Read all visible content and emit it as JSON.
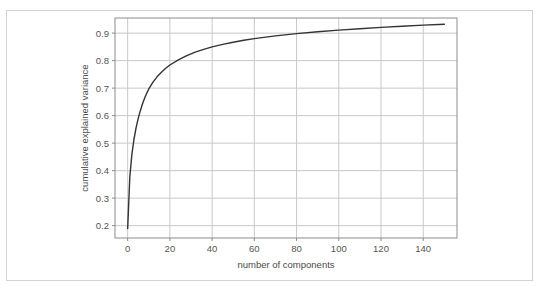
{
  "figure": {
    "background_color": "#ffffff",
    "frame_color": "#d2d2d2",
    "plot_border_color": "#8c8c8c",
    "grid_color": "#c8c8c8",
    "line_color": "#333333"
  },
  "chart_data": {
    "type": "line",
    "title": "",
    "xlabel": "number of components",
    "ylabel": "cumulative explained variance",
    "xlim": [
      -6,
      156
    ],
    "ylim": [
      0.155,
      0.955
    ],
    "grid": true,
    "legend": null,
    "xticks": [
      0,
      20,
      40,
      60,
      80,
      100,
      120,
      140
    ],
    "xtick_labels": [
      "0",
      "20",
      "40",
      "60",
      "80",
      "100",
      "120",
      "140"
    ],
    "yticks": [
      0.2,
      0.3,
      0.4,
      0.5,
      0.6,
      0.7,
      0.8,
      0.9
    ],
    "ytick_labels": [
      "0.2",
      "0.3",
      "0.4",
      "0.5",
      "0.6",
      "0.7",
      "0.8",
      "0.9"
    ],
    "series": [
      {
        "name": "cumulative explained variance",
        "color": "#333333",
        "x": [
          0,
          1,
          2,
          3,
          4,
          5,
          6,
          7,
          8,
          9,
          10,
          12,
          14,
          16,
          18,
          20,
          24,
          28,
          32,
          36,
          40,
          45,
          50,
          55,
          60,
          70,
          80,
          90,
          100,
          110,
          120,
          130,
          140,
          150
        ],
        "y": [
          0.19,
          0.375,
          0.46,
          0.515,
          0.556,
          0.59,
          0.618,
          0.642,
          0.663,
          0.681,
          0.697,
          0.722,
          0.742,
          0.758,
          0.772,
          0.784,
          0.803,
          0.818,
          0.831,
          0.841,
          0.85,
          0.859,
          0.867,
          0.874,
          0.88,
          0.89,
          0.898,
          0.905,
          0.911,
          0.916,
          0.921,
          0.925,
          0.929,
          0.932
        ]
      }
    ]
  }
}
